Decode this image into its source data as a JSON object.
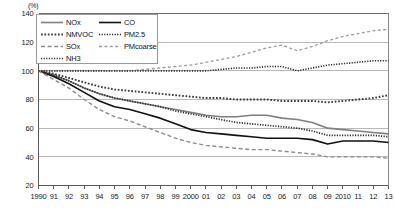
{
  "chart_data": {
    "type": "line",
    "title": "",
    "subtitle": "",
    "xlabel": "",
    "ylabel": "",
    "unit_label": "(%)",
    "grid": true,
    "legend_position": "top-left",
    "xlim": [
      1990,
      2013
    ],
    "ylim": [
      20,
      140
    ],
    "ytick_values": [
      20,
      40,
      60,
      80,
      100,
      120,
      140
    ],
    "ytick_labels": [
      "20",
      "40",
      "60",
      "80",
      "100",
      "120",
      "140"
    ],
    "x": [
      1990,
      1991,
      1992,
      1993,
      1994,
      1995,
      1996,
      1997,
      1998,
      1999,
      2000,
      2001,
      2002,
      2003,
      2004,
      2005,
      2006,
      2007,
      2008,
      2009,
      2010,
      2011,
      2012,
      2013
    ],
    "xtick_labels": [
      "1990",
      "91",
      "92",
      "93",
      "94",
      "95",
      "96",
      "97",
      "98",
      "99",
      "2000",
      "01",
      "02",
      "03",
      "04",
      "05",
      "06",
      "07",
      "08",
      "09",
      "2010",
      "11",
      "12",
      "13"
    ],
    "series": [
      {
        "name": "NOx",
        "style": "solid",
        "color": "#7f7f7f",
        "width": 1.6,
        "values": [
          100,
          97,
          93,
          88,
          84,
          81,
          79,
          77,
          75,
          73,
          71,
          69,
          68,
          68,
          69,
          69,
          67,
          66,
          64,
          60,
          59,
          58,
          57,
          56
        ]
      },
      {
        "name": "CO",
        "style": "solid",
        "color": "#111111",
        "width": 1.6,
        "values": [
          100,
          96,
          91,
          85,
          79,
          75,
          73,
          70,
          67,
          63,
          59,
          57,
          56,
          55,
          54,
          53,
          53,
          53,
          52,
          49,
          51,
          51,
          51,
          50
        ]
      },
      {
        "name": "NMVOC",
        "style": "dotted-bold",
        "color": "#3a3a3a",
        "width": 1.9,
        "values": [
          100,
          98,
          95,
          92,
          89,
          87,
          86,
          85,
          84,
          83,
          82,
          81,
          81,
          80,
          80,
          80,
          79,
          79,
          79,
          78,
          79,
          80,
          81,
          83
        ]
      },
      {
        "name": "PM2.5",
        "style": "dotted-fine",
        "color": "#2b2b2b",
        "width": 1.7,
        "values": [
          100,
          97,
          93,
          88,
          84,
          81,
          79,
          77,
          75,
          72,
          70,
          68,
          66,
          64,
          63,
          62,
          61,
          60,
          58,
          55,
          55,
          55,
          55,
          54
        ]
      },
      {
        "name": "SOx",
        "style": "dashed",
        "color": "#8c8c8c",
        "width": 1.4,
        "values": [
          100,
          94,
          88,
          80,
          73,
          68,
          65,
          61,
          57,
          53,
          50,
          48,
          47,
          46,
          45,
          45,
          44,
          43,
          42,
          40,
          40,
          40,
          40,
          39
        ]
      },
      {
        "name": "PMcoarse",
        "style": "dashed-light",
        "color": "#9d9d9d",
        "width": 1.3,
        "values": [
          100,
          100,
          100,
          100,
          100,
          100,
          100,
          101,
          102,
          103,
          104,
          106,
          108,
          110,
          113,
          116,
          118,
          114,
          117,
          121,
          124,
          126,
          128,
          129
        ]
      },
      {
        "name": "NH3",
        "style": "dotted-fine",
        "color": "#2b2b2b",
        "width": 1.6,
        "values": [
          100,
          100,
          100,
          100,
          100,
          100,
          100,
          100,
          100,
          100,
          100,
          100,
          101,
          102,
          102,
          103,
          103,
          100,
          102,
          104,
          105,
          106,
          107,
          107
        ]
      }
    ],
    "legend": {
      "column1": [
        "NOx",
        "NMVOC",
        "SOx",
        "NH3"
      ],
      "column2": [
        "CO",
        "PM2.5",
        "PMcoarse"
      ]
    }
  }
}
